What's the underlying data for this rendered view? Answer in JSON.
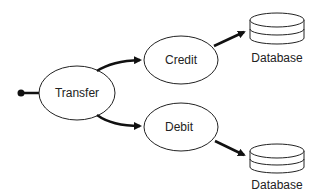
{
  "diagram": {
    "nodes": [
      {
        "id": "transfer",
        "label": "Transfer",
        "shape": "ellipse"
      },
      {
        "id": "credit",
        "label": "Credit",
        "shape": "ellipse"
      },
      {
        "id": "debit",
        "label": "Debit",
        "shape": "ellipse"
      },
      {
        "id": "db_top",
        "label": "Database",
        "shape": "database-icon"
      },
      {
        "id": "db_bottom",
        "label": "Database",
        "shape": "database-icon"
      }
    ],
    "edges": [
      {
        "from": "start",
        "to": "transfer"
      },
      {
        "from": "transfer",
        "to": "credit"
      },
      {
        "from": "transfer",
        "to": "debit"
      },
      {
        "from": "credit",
        "to": "db_top"
      },
      {
        "from": "debit",
        "to": "db_bottom"
      }
    ],
    "colors": {
      "stroke": "#111111",
      "background": "#ffffff"
    }
  }
}
